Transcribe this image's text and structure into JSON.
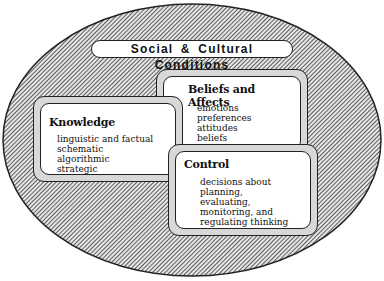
{
  "diagram": {
    "outer": {
      "label": "Social & Cultural Conditions",
      "shape": "ellipse",
      "fill": "hatched"
    },
    "boxes": [
      {
        "id": "beliefs",
        "title": "Beliefs and Affects",
        "items": [
          "emotions",
          "preferences",
          "attitudes",
          "beliefs"
        ]
      },
      {
        "id": "knowledge",
        "title": "Knowledge",
        "items": [
          "linguistic and factual",
          "schematic",
          "algorithmic",
          "strategic"
        ]
      },
      {
        "id": "control",
        "title": "Control",
        "items": [
          "decisions about",
          "planning,",
          "evaluating,",
          "monitoring, and",
          "regulating thinking"
        ]
      }
    ]
  },
  "colors": {
    "ink": "#222222",
    "frame": "#d8d8d8",
    "background": "#ffffff"
  }
}
